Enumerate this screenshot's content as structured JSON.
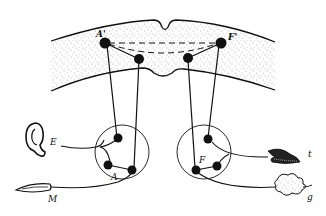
{
  "figure": {
    "labels": {
      "cortex_left_node": "A'",
      "cortex_right_node": "F'",
      "left_center": "A",
      "right_center": "F",
      "ear": "E",
      "muscle": "M",
      "tongue": "t",
      "gland": "g"
    },
    "colors": {
      "ink": "#111111",
      "background": "#ffffff",
      "stipple": "#555555"
    }
  }
}
